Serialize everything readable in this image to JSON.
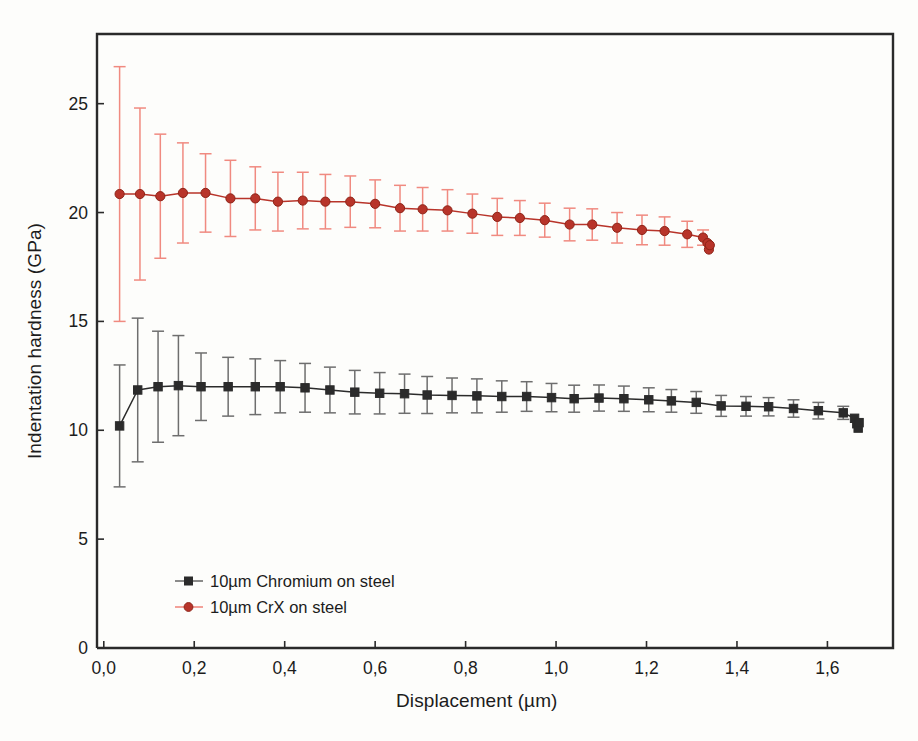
{
  "chart_data": {
    "type": "line",
    "title": "",
    "xlabel": "Displacement (µm)",
    "ylabel": "Indentation hardness (GPa)",
    "xlim": [
      -0.015,
      1.745
    ],
    "ylim": [
      0,
      28.2
    ],
    "xticks": [
      0.0,
      0.2,
      0.4,
      0.6,
      0.8,
      1.0,
      1.2,
      1.4,
      1.6
    ],
    "xtick_labels": [
      "0,0",
      "0,2",
      "0,4",
      "0,6",
      "0,8",
      "1,0",
      "1,2",
      "1,4",
      "1,6"
    ],
    "yticks": [
      0,
      5,
      10,
      15,
      20,
      25
    ],
    "ytick_labels": [
      "0",
      "5",
      "10",
      "15",
      "20",
      "25"
    ],
    "grid": false,
    "legend_position": "lower-left-inside",
    "error_bars": "symmetric-vertical-with-caps",
    "series": [
      {
        "name": "10µm Chromium on steel",
        "color": "#2b2b2b",
        "error_color": "#6e6e6e",
        "marker": "square",
        "x": [
          0.035,
          0.075,
          0.12,
          0.165,
          0.215,
          0.275,
          0.335,
          0.39,
          0.445,
          0.5,
          0.555,
          0.61,
          0.665,
          0.715,
          0.77,
          0.825,
          0.88,
          0.935,
          0.99,
          1.04,
          1.095,
          1.15,
          1.205,
          1.255,
          1.31,
          1.365,
          1.42,
          1.47,
          1.525,
          1.58,
          1.635,
          1.66,
          1.665,
          1.668,
          1.67
        ],
        "y": [
          10.2,
          11.85,
          12.0,
          12.05,
          12.0,
          12.0,
          12.0,
          12.0,
          11.95,
          11.85,
          11.75,
          11.7,
          11.68,
          11.62,
          11.6,
          11.58,
          11.55,
          11.55,
          11.5,
          11.45,
          11.48,
          11.45,
          11.4,
          11.35,
          11.28,
          11.12,
          11.1,
          11.08,
          11.0,
          10.9,
          10.8,
          10.55,
          10.3,
          10.1,
          10.35
        ],
        "yerr": [
          2.8,
          3.3,
          2.55,
          2.3,
          1.55,
          1.35,
          1.28,
          1.2,
          1.12,
          1.05,
          1.0,
          0.95,
          0.9,
          0.85,
          0.8,
          0.78,
          0.72,
          0.68,
          0.65,
          0.62,
          0.6,
          0.58,
          0.55,
          0.52,
          0.5,
          0.48,
          0.45,
          0.42,
          0.4,
          0.38,
          0.3,
          0.0,
          0.0,
          0.0,
          0.0
        ]
      },
      {
        "name": "10µm CrX on steel",
        "color": "#b8342a",
        "error_color": "#f08a80",
        "marker": "circle",
        "x": [
          0.035,
          0.08,
          0.125,
          0.175,
          0.225,
          0.28,
          0.335,
          0.385,
          0.44,
          0.49,
          0.545,
          0.6,
          0.655,
          0.705,
          0.76,
          0.815,
          0.87,
          0.92,
          0.975,
          1.03,
          1.08,
          1.135,
          1.19,
          1.24,
          1.29,
          1.325,
          1.335,
          1.338,
          1.34
        ],
        "y": [
          20.85,
          20.85,
          20.75,
          20.9,
          20.9,
          20.65,
          20.65,
          20.5,
          20.55,
          20.5,
          20.5,
          20.4,
          20.2,
          20.15,
          20.1,
          19.95,
          19.8,
          19.75,
          19.65,
          19.45,
          19.45,
          19.3,
          19.2,
          19.15,
          19.0,
          18.85,
          18.6,
          18.3,
          18.5
        ],
        "yerr": [
          5.85,
          3.95,
          2.85,
          2.3,
          1.8,
          1.75,
          1.45,
          1.35,
          1.3,
          1.25,
          1.18,
          1.1,
          1.05,
          1.0,
          0.95,
          0.9,
          0.85,
          0.8,
          0.78,
          0.75,
          0.72,
          0.7,
          0.68,
          0.65,
          0.6,
          0.35,
          0.0,
          0.0,
          0.0
        ]
      }
    ]
  },
  "legend": {
    "items": [
      {
        "label": "10µm Chromium on steel"
      },
      {
        "label": "10µm CrX on steel"
      }
    ]
  }
}
